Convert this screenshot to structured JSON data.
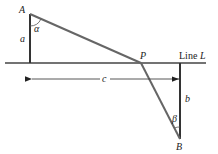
{
  "diagram": {
    "points": {
      "A": {
        "label": "A",
        "x": 30,
        "y": 14
      },
      "P": {
        "label": "P",
        "x": 141,
        "y": 63
      },
      "B": {
        "label": "B",
        "x": 180,
        "y": 139
      }
    },
    "line_label_prefix": "Line",
    "line_label_var": "L",
    "segment_labels": {
      "a": "a",
      "b": "b",
      "c": "c"
    },
    "angle_labels": {
      "alpha": "α",
      "beta": "β"
    },
    "colors": {
      "stroke": "#333333",
      "path": "#666666",
      "background": "#ffffff"
    }
  }
}
